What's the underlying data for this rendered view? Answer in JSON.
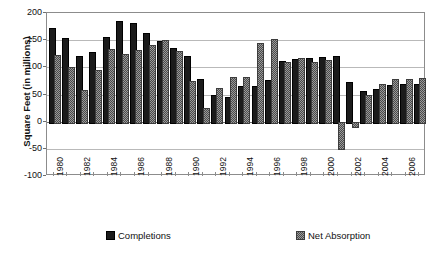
{
  "chart_data": {
    "type": "bar",
    "title": "",
    "xlabel": "",
    "ylabel": "Square Feet (in millions)",
    "ylim": [
      -100,
      200
    ],
    "yticks": [
      200,
      150,
      100,
      50,
      0,
      -50,
      -100
    ],
    "ytick_labels": [
      "200",
      "150",
      "100",
      "50",
      "0",
      "-50",
      "-100"
    ],
    "grid": true,
    "legend_position": "bottom",
    "categories": [
      "1980",
      "1981",
      "1982",
      "1983",
      "1984",
      "1985",
      "1986",
      "1987",
      "1988",
      "1989",
      "1990",
      "1991",
      "1992",
      "1993",
      "1994",
      "1995",
      "1996",
      "1997",
      "1998",
      "1999",
      "2000",
      "2001",
      "2002",
      "2003",
      "2004",
      "2005",
      "2006",
      "2007"
    ],
    "xtick_labels_shown": [
      "1980",
      "1982",
      "1984",
      "1986",
      "1988",
      "1990",
      "1992",
      "1994",
      "1996",
      "1998",
      "2000",
      "2002",
      "2004",
      "2006"
    ],
    "series": [
      {
        "name": "Completions",
        "color": "#1b1b1b",
        "values": [
          172,
          154,
          121,
          128,
          156,
          186,
          182,
          164,
          148,
          136,
          121,
          79,
          50,
          46,
          66,
          66,
          76,
          112,
          115,
          117,
          119,
          120,
          73,
          57,
          60,
          68,
          70,
          70
        ]
      },
      {
        "name": "Net Absorption",
        "color": "#9a9a9a",
        "values": [
          123,
          100,
          59,
          96,
          133,
          124,
          131,
          142,
          151,
          130,
          74,
          26,
          62,
          83,
          83,
          144,
          153,
          110,
          117,
          109,
          113,
          -48,
          -8,
          49,
          70,
          78,
          78,
          80
        ]
      }
    ]
  },
  "legend": {
    "items": [
      {
        "label": "Completions",
        "swatch": "completions"
      },
      {
        "label": "Net Absorption",
        "swatch": "absorption"
      }
    ]
  },
  "axis": {
    "y_title": "Square Feet (in millions)"
  }
}
